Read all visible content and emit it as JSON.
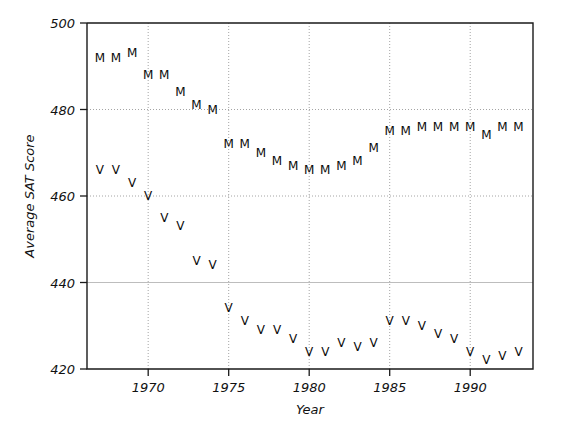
{
  "chart_data": {
    "type": "scatter",
    "title": "",
    "xlabel": "Year",
    "ylabel": "Average SAT Score",
    "xlim": [
      1966.2,
      1993.9
    ],
    "ylim": [
      420,
      500
    ],
    "xticks": [
      1970,
      1975,
      1980,
      1985,
      1990
    ],
    "xtick_labels": [
      "1970",
      "1975",
      "1980",
      "1985",
      "1990"
    ],
    "yticks": [
      420,
      440,
      460,
      480,
      500
    ],
    "ytick_labels": [
      "420",
      "440",
      "460",
      "480",
      "500"
    ],
    "grid": true,
    "grid_style": "dotted",
    "legend": "none",
    "marker_style": "letter-glyph",
    "x": [
      1967,
      1968,
      1969,
      1970,
      1971,
      1972,
      1973,
      1974,
      1975,
      1976,
      1977,
      1978,
      1979,
      1980,
      1981,
      1982,
      1983,
      1984,
      1985,
      1986,
      1987,
      1988,
      1989,
      1990,
      1991,
      1992,
      1993
    ],
    "series": [
      {
        "name": "M",
        "label": "Math",
        "marker": "M",
        "color": "#0b0b0b",
        "values": [
          492,
          492,
          493,
          488,
          488,
          484,
          481,
          480,
          472,
          472,
          470,
          468,
          467,
          466,
          466,
          467,
          468,
          471,
          475,
          475,
          476,
          476,
          476,
          476,
          474,
          476,
          476
        ]
      },
      {
        "name": "V",
        "label": "Verbal",
        "marker": "V",
        "color": "#0b0b0b",
        "values": [
          466,
          466,
          463,
          460,
          455,
          453,
          445,
          444,
          434,
          431,
          429,
          429,
          427,
          424,
          424,
          426,
          425,
          426,
          431,
          431,
          430,
          428,
          427,
          424,
          422,
          423,
          424
        ]
      }
    ]
  },
  "axes": {
    "y_title": "Average SAT Score",
    "x_title": "Year"
  }
}
